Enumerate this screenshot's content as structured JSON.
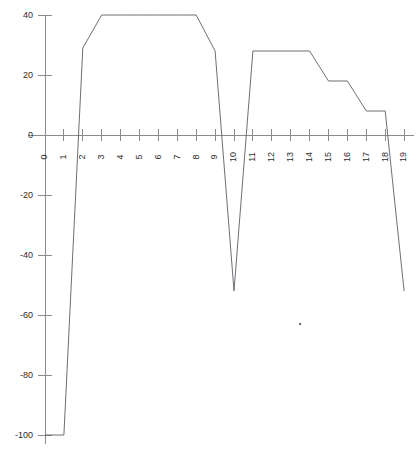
{
  "chart_data": {
    "type": "line",
    "title": "",
    "subtitle": "",
    "xlabel": "",
    "ylabel": "",
    "x": [
      0,
      1,
      2,
      3,
      4,
      5,
      6,
      7,
      8,
      9,
      10,
      11,
      12,
      13,
      14,
      15,
      16,
      17,
      18,
      19
    ],
    "values": [
      -100,
      -100,
      29,
      40,
      40,
      40,
      40,
      40,
      40,
      28,
      -52,
      28,
      28,
      28,
      28,
      18,
      18,
      8,
      8,
      -52
    ],
    "series": [
      {
        "name": "series-1",
        "values": [
          -100,
          -100,
          29,
          40,
          40,
          40,
          40,
          40,
          40,
          28,
          -52,
          28,
          28,
          28,
          28,
          18,
          18,
          8,
          8,
          -52
        ]
      }
    ],
    "xlim": [
      0,
      19
    ],
    "ylim": [
      -100,
      40
    ],
    "grid": false,
    "legend": false,
    "legend_position": "none",
    "x_tick_labels": [
      "0",
      "1",
      "2",
      "3",
      "4",
      "5",
      "6",
      "7",
      "8",
      "9",
      "10",
      "11",
      "12",
      "13",
      "14",
      "15",
      "16",
      "17",
      "18",
      "19"
    ],
    "y_tick_labels": [
      "40",
      "20",
      "0",
      "-20",
      "-40",
      "-60",
      "-80",
      "-100"
    ],
    "y_tick_values": [
      40,
      20,
      0,
      -20,
      -40,
      -60,
      -80,
      -100
    ],
    "x_tick_values": [
      0,
      1,
      2,
      3,
      4,
      5,
      6,
      7,
      8,
      9,
      10,
      11,
      12,
      13,
      14,
      15,
      16,
      17,
      18,
      19
    ],
    "x_tick_label_rotation": -90,
    "axis_color": "#8a8a8a",
    "series_color": "#5e5e66",
    "background_color": "#ffffff",
    "annotations": [
      {
        "name": "speck-mark",
        "x": 13.5,
        "y": -63,
        "label": ""
      }
    ]
  },
  "geometry": {
    "x0_px": 45,
    "x_step_px": 18.9,
    "y_zero_px": 135,
    "y_unit_px": 3.0,
    "axis_x_end_px": 414,
    "axis_y_top_px": 14,
    "axis_y_bottom_px": 444
  }
}
